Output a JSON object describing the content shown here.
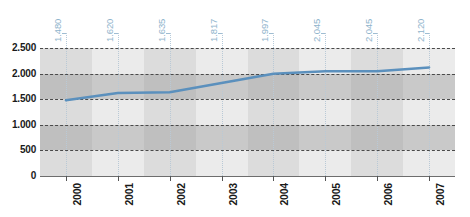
{
  "chart_data": {
    "type": "line",
    "title": "",
    "xlabel": "",
    "ylabel": "",
    "categories": [
      "2000",
      "2001",
      "2002",
      "2003",
      "2004",
      "2005",
      "2006",
      "2007"
    ],
    "values": [
      1480,
      1620,
      1635,
      1817,
      1997,
      2045,
      2045,
      2120
    ],
    "point_labels": [
      "1.480",
      "1.620",
      "1.635",
      "1.817",
      "1.997",
      "2.045",
      "2.045",
      "2.120"
    ],
    "ylim": [
      0,
      2500
    ],
    "ytick_values": [
      0,
      500,
      1000,
      1500,
      2000,
      2500
    ],
    "ytick_labels": [
      "0",
      "500",
      "1.000",
      "1.500",
      "2.000",
      "2.500"
    ],
    "grid": true,
    "grid_style": "dashed-horizontal",
    "legend": "none",
    "series": [
      {
        "name": "series-1",
        "color": "#5b90bd",
        "values": [
          1480,
          1620,
          1635,
          1817,
          1997,
          2045,
          2045,
          2120
        ]
      }
    ],
    "colors": {
      "line": "#5b90bd",
      "point_label": "#8fb4cc",
      "band_dark": "#c9c9c9",
      "band_light": "#ebebeb",
      "plot_background": "#ececed",
      "axis_text": "#1a1a1a",
      "gridline": "#4a4a4a"
    },
    "bands": [
      {
        "from": 2000,
        "to": 2500,
        "tone": "light"
      },
      {
        "from": 1500,
        "to": 2000,
        "tone": "dark"
      },
      {
        "from": 1000,
        "to": 1500,
        "tone": "light"
      },
      {
        "from": 500,
        "to": 1000,
        "tone": "dark"
      },
      {
        "from": 0,
        "to": 500,
        "tone": "light"
      }
    ]
  }
}
